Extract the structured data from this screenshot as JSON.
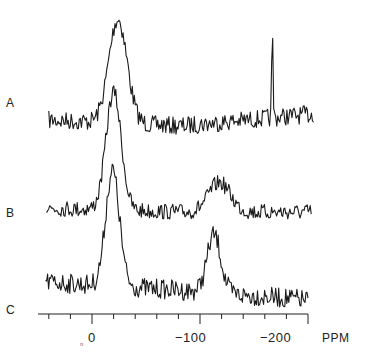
{
  "chart_data": {
    "type": "line",
    "title": "",
    "xlabel": "PPM",
    "ylabel": "",
    "x_range": [
      50,
      -200
    ],
    "x_reversed": true,
    "grid": false,
    "legend": "none",
    "x_ticks_major": [
      0,
      -100,
      -200
    ],
    "x_tick_labels": [
      "0",
      "−100",
      "−200"
    ],
    "x_ticks_minor_step": 20,
    "series": [
      {
        "name": "A",
        "label": "A",
        "baseline_ppm_range": [
          40,
          -205
        ],
        "peaks": [
          {
            "ppm": -24,
            "relative_height": 1.0,
            "width": "broad"
          },
          {
            "ppm": -167,
            "relative_height": 0.8,
            "width": "very narrow spike"
          }
        ]
      },
      {
        "name": "B",
        "label": "B",
        "baseline_ppm_range": [
          42,
          -203
        ],
        "peaks": [
          {
            "ppm": -20,
            "relative_height": 1.0,
            "width": "broad"
          },
          {
            "ppm": -118,
            "relative_height": 0.25,
            "width": "broad hump"
          }
        ]
      },
      {
        "name": "C",
        "label": "C",
        "baseline_ppm_range": [
          43,
          -200
        ],
        "peaks": [
          {
            "ppm": -19,
            "relative_height": 1.0,
            "width": "broad"
          },
          {
            "ppm": -113,
            "relative_height": 0.5,
            "width": "broad hump"
          }
        ]
      }
    ]
  },
  "labels": {
    "a": "A",
    "b": "B",
    "c": "C",
    "tick_0": "0",
    "tick_100": "−100",
    "tick_200": "−200",
    "unit": "PPM",
    "footnote_mark": "ⁿ"
  }
}
